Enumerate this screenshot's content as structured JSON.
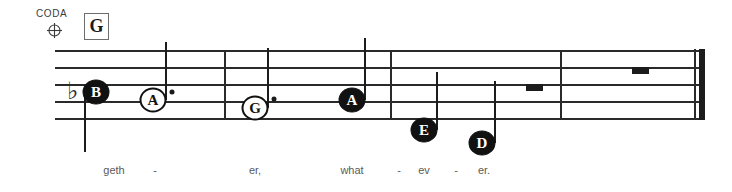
{
  "score": {
    "coda": {
      "label": "CODA",
      "symbol_name": "coda-symbol"
    },
    "rehearsal_mark": {
      "letter": "G"
    },
    "staff": {
      "line_count": 5,
      "left": 55,
      "right": 705,
      "top": 50,
      "line_spacing": 17,
      "color": "#2a2a2a"
    },
    "barlines": [
      {
        "name": "barline-1",
        "x": 224
      },
      {
        "name": "barline-2",
        "x": 390
      },
      {
        "name": "barline-3",
        "x": 560
      }
    ],
    "final_barline": {
      "x": 694,
      "type": "thin-thick"
    },
    "accidentals": [
      {
        "name": "flat-sign",
        "glyph": "♭",
        "x": 72,
        "y": 91
      }
    ],
    "notes": [
      {
        "name": "note-b-flat",
        "letter": "B",
        "x": 96,
        "y": 92,
        "head": "filled",
        "stem": "down",
        "stem_end": 152,
        "dotted": false
      },
      {
        "name": "note-a-dotted",
        "letter": "A",
        "x": 153,
        "y": 100,
        "head": "open",
        "stem": "up",
        "stem_end": 42,
        "dotted": true,
        "dot_x": 172,
        "dot_y": 92
      },
      {
        "name": "note-g-dotted",
        "letter": "G",
        "x": 255,
        "y": 108,
        "head": "open",
        "stem": "up",
        "stem_end": 48,
        "dotted": true,
        "dot_x": 274,
        "dot_y": 99
      },
      {
        "name": "note-a-second",
        "letter": "A",
        "x": 352,
        "y": 100,
        "head": "filled",
        "stem": "up",
        "stem_end": 38,
        "dotted": false
      },
      {
        "name": "note-e",
        "letter": "E",
        "x": 424,
        "y": 130,
        "head": "filled",
        "stem": "up",
        "stem_end": 72,
        "dotted": false
      },
      {
        "name": "note-d",
        "letter": "D",
        "x": 482,
        "y": 143,
        "head": "filled",
        "stem": "up",
        "stem_end": 81,
        "dotted": false
      }
    ],
    "rests": [
      {
        "name": "rest-half-1",
        "type": "half",
        "x": 526,
        "y": 84
      },
      {
        "name": "rest-half-2",
        "type": "half",
        "x": 632,
        "y": 67
      }
    ],
    "lyrics": [
      {
        "name": "lyric-geth",
        "text": "geth",
        "x": 114
      },
      {
        "name": "lyric-hyphen-1",
        "text": "-",
        "x": 155
      },
      {
        "name": "lyric-er",
        "text": "er,",
        "x": 255
      },
      {
        "name": "lyric-what",
        "text": "what",
        "x": 352
      },
      {
        "name": "lyric-hyphen-2",
        "text": "-",
        "x": 399
      },
      {
        "name": "lyric-ev",
        "text": "ev",
        "x": 424
      },
      {
        "name": "lyric-hyphen-3",
        "text": "-",
        "x": 456
      },
      {
        "name": "lyric-er-final",
        "text": "er.",
        "x": 484
      }
    ]
  }
}
